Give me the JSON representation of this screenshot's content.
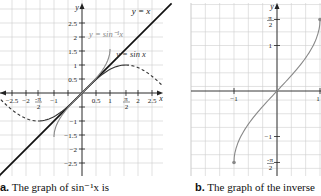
{
  "chart_data": [
    {
      "type": "line",
      "panel": "a",
      "caption_letter": "a.",
      "caption_text": "The graph of sin⁻¹x is",
      "xlabel": "x",
      "ylabel": "y",
      "x_tick_labels": [
        "-2.5",
        "-2",
        "-π/2",
        "-1",
        "0.5",
        "1",
        "π/2",
        "2",
        "2.5"
      ],
      "y_tick_labels": [
        "2.5",
        "2",
        "1.5",
        "1",
        "0.5",
        "-1",
        "-1.5",
        "-2",
        "-2.5"
      ],
      "xlim": [
        -2.9,
        2.9
      ],
      "ylim": [
        -2.9,
        2.9
      ],
      "grid": true,
      "series": [
        {
          "name": "y = x",
          "style": "solid-thick",
          "color": "#111111",
          "x": [
            -2.9,
            2.9
          ],
          "y": [
            -2.9,
            2.9
          ]
        },
        {
          "name": "y = sin x",
          "style": "solid",
          "color": "#333333",
          "x": [
            -1.5708,
            -1.0,
            -0.5,
            0,
            0.5,
            1.0,
            1.5708
          ],
          "y": [
            -1.0,
            -0.841,
            -0.479,
            0,
            0.479,
            0.841,
            1.0
          ]
        },
        {
          "name": "y = sin x (continued)",
          "style": "dashed",
          "color": "#333333",
          "x": [
            1.5708,
            2.0,
            2.5,
            2.9
          ],
          "y": [
            1.0,
            0.909,
            0.598,
            0.239
          ]
        },
        {
          "name": "y = sin x (continued, negative)",
          "style": "dashed",
          "color": "#333333",
          "x": [
            -2.9,
            -2.5,
            -2.0,
            -1.5708
          ],
          "y": [
            -0.239,
            -0.598,
            -0.909,
            -1.0
          ]
        },
        {
          "name": "y = sin⁻¹x",
          "style": "solid",
          "color": "#888888",
          "x": [
            -1.0,
            -0.9,
            -0.5,
            0,
            0.5,
            0.9,
            1.0
          ],
          "y": [
            -1.5708,
            -1.12,
            -0.524,
            0,
            0.524,
            1.12,
            1.5708
          ]
        }
      ],
      "annotations": [
        "y = x",
        "y = sin⁻¹x",
        "y = sin x"
      ]
    },
    {
      "type": "line",
      "panel": "b",
      "caption_letter": "b.",
      "caption_text": "The graph of the inverse",
      "xlabel": "",
      "ylabel": "y",
      "x_tick_labels": [
        "-1",
        "1"
      ],
      "y_tick_labels": [
        "π/2",
        "1",
        "-1",
        "-π/2"
      ],
      "xlim": [
        -2,
        1
      ],
      "ylim": [
        -1.8,
        1.8
      ],
      "grid": true,
      "series": [
        {
          "name": "y = sin⁻¹x",
          "style": "solid",
          "color": "#888888",
          "x": [
            -1.0,
            -0.9,
            -0.5,
            0,
            0.5,
            0.9,
            1.0
          ],
          "y": [
            -1.5708,
            -1.12,
            -0.524,
            0,
            0.524,
            1.12,
            1.5708
          ],
          "endpoints": "closed"
        }
      ]
    }
  ],
  "labels": {
    "a": {
      "y_axis": "y",
      "x_axis": "x",
      "line_yx": "y = x",
      "line_arcsin": "y = sin⁻¹x",
      "line_sin": "y = sin x",
      "caption_letter": "a.",
      "caption_text": "The graph of sin⁻¹x is"
    },
    "b": {
      "y_axis": "y",
      "caption_letter": "b.",
      "caption_text": "The graph of the inverse"
    }
  }
}
